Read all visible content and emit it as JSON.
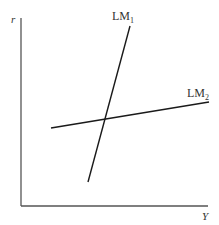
{
  "diagram": {
    "type": "economics-lm-curves",
    "axes": {
      "y_label": "r",
      "x_label": "Y"
    },
    "curves": [
      {
        "name": "LM",
        "subscript": "1",
        "description": "steep upward-sloping line",
        "start": [
          88,
          182
        ],
        "end": [
          130,
          26
        ]
      },
      {
        "name": "LM",
        "subscript": "2",
        "description": "nearly flat upward-sloping line",
        "start": [
          51,
          128
        ],
        "end": [
          209,
          102
        ]
      }
    ],
    "colors": {
      "axis": "#555555",
      "curve": "#1a1a1a",
      "text": "#333333"
    }
  }
}
